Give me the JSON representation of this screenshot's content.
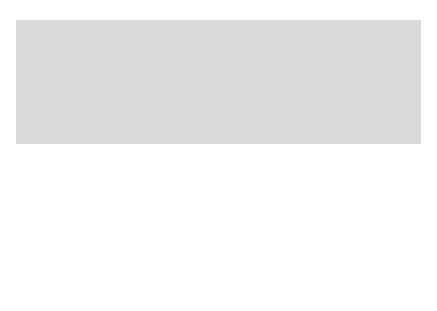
{
  "map": {
    "title": "Mexico, 1824",
    "compass": {
      "north_label": "N"
    },
    "scale": {
      "label": "0   300   600 km",
      "ticks": [
        "0",
        "300",
        "600 km"
      ]
    },
    "oceans": {
      "pacific": [
        "PACIFIC",
        "OCEAN"
      ],
      "atlantic": [
        "ATLANTIC",
        "OCEAN"
      ],
      "gulf": [
        "Gulf",
        "of",
        "Mexico"
      ]
    },
    "countries": {
      "usa": [
        "UNITED STATES",
        "OF AMERICA",
        "and its territories"
      ]
    },
    "states": [
      {
        "id": "alta-california",
        "label": "ALTA CALIFORNIA"
      },
      {
        "id": "nuevo-mexico",
        "label": [
          "NUEVO",
          "MÉXICO"
        ]
      },
      {
        "id": "sonora-y-sinaloa",
        "label": [
          "SONORA",
          "Y",
          "SINALOA"
        ]
      },
      {
        "id": "coahuila-y-tejas",
        "label": [
          "COAHUILA",
          "Y",
          "TEJAS"
        ]
      },
      {
        "id": "chihuahua",
        "label": "CHIHUAHUA"
      },
      {
        "id": "baja-california",
        "label": "BAJA CALIFORNIA"
      },
      {
        "id": "durango",
        "label": "DURANGO"
      },
      {
        "id": "nuevo-leon",
        "label": [
          "NUEVO",
          "LEÓN"
        ]
      },
      {
        "id": "tamaulipas",
        "label": "TAMAULIPAS"
      },
      {
        "id": "san-luis-potosi",
        "label": "SAN LUIS POTOSÍ"
      },
      {
        "id": "veracruz-north",
        "label": "VERACRUZ"
      },
      {
        "id": "queretaro",
        "label": "QUERÉTARO"
      },
      {
        "id": "veracruz-south",
        "label": "VERACRUZ"
      },
      {
        "id": "zacatecas",
        "label": "ZACATECAS"
      },
      {
        "id": "jalisco",
        "label": "JALISCO"
      },
      {
        "id": "guanajuato",
        "label": "GUANAJUATO"
      },
      {
        "id": "michoacan",
        "label": "MICHOACÁN"
      },
      {
        "id": "mexico",
        "label": "MÉXICO"
      },
      {
        "id": "puebla",
        "label": "PUEBLA"
      },
      {
        "id": "oaxaca",
        "label": "OAXACA"
      },
      {
        "id": "chiapas",
        "label": "CHIAPAS"
      },
      {
        "id": "tabasco",
        "label": "TABASCO"
      },
      {
        "id": "yucatan",
        "label": "YUCATAN"
      }
    ],
    "colors": {
      "sea": "#d9d9d9",
      "mexico": "#a6a6a6",
      "usa": "#ffffff",
      "border": "#333333"
    }
  }
}
